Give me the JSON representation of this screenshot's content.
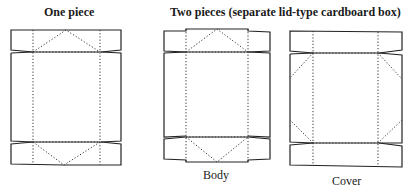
{
  "titles": {
    "one_piece": "One piece",
    "two_pieces": "Two pieces  (separate lid-type cardboard box)"
  },
  "captions": {
    "body": "Body",
    "cover": "Cover"
  },
  "diagrams": [
    {
      "name": "one-piece-box-template",
      "label": "One piece"
    },
    {
      "name": "body-box-template",
      "label": "Body"
    },
    {
      "name": "cover-box-template",
      "label": "Cover"
    }
  ],
  "colors": {
    "line": "#222222",
    "background": "#ffffff"
  }
}
